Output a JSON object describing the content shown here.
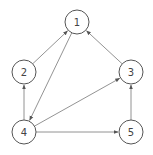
{
  "diagram": {
    "type": "directed-graph",
    "nodes": [
      {
        "id": "1",
        "label": "1",
        "x": 77,
        "y": 22
      },
      {
        "id": "2",
        "label": "2",
        "x": 24,
        "y": 72
      },
      {
        "id": "3",
        "label": "3",
        "x": 131,
        "y": 72
      },
      {
        "id": "4",
        "label": "4",
        "x": 24,
        "y": 132
      },
      {
        "id": "5",
        "label": "5",
        "x": 131,
        "y": 132
      }
    ],
    "edges": [
      {
        "from": "2",
        "to": "1"
      },
      {
        "from": "1",
        "to": "4"
      },
      {
        "from": "3",
        "to": "1"
      },
      {
        "from": "4",
        "to": "2"
      },
      {
        "from": "4",
        "to": "3"
      },
      {
        "from": "4",
        "to": "5"
      },
      {
        "from": "5",
        "to": "3"
      }
    ],
    "node_radius": 12,
    "colors": {
      "stroke": "#555555",
      "edge": "#777777",
      "text": "#444444"
    }
  }
}
